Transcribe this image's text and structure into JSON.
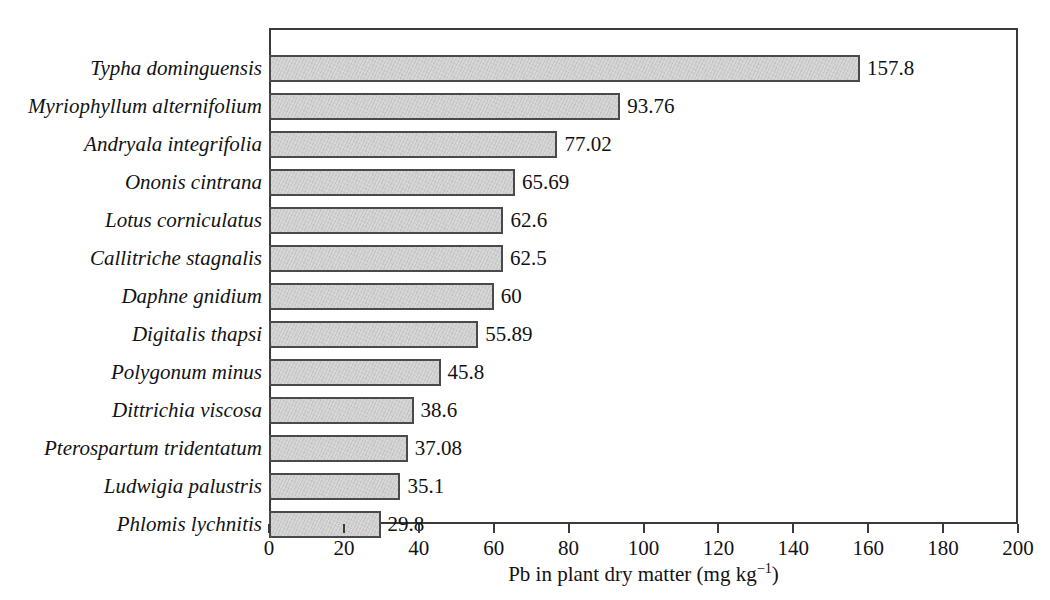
{
  "chart_data": {
    "type": "bar",
    "orientation": "horizontal",
    "title": "",
    "subtitle": "",
    "xlabel": "Pb in plant dry matter (mg kg⁻¹)",
    "xlabel_parts": {
      "prefix": "Pb in plant dry matter (mg kg",
      "exponent": "−1",
      "suffix": ")"
    },
    "ylabel": "",
    "xlim": [
      0,
      200
    ],
    "xticks": [
      0,
      20,
      40,
      60,
      80,
      100,
      120,
      140,
      160,
      180,
      200
    ],
    "xtick_labels": [
      "0",
      "20",
      "40",
      "60",
      "80",
      "100",
      "120",
      "140",
      "160",
      "180",
      "200"
    ],
    "grid": false,
    "legend": null,
    "bar_fill_color": "#d7d7d7",
    "bar_border_color": "#4a4a4a",
    "axis_color": "#3a3a3a",
    "categories": [
      "Typha dominguensis",
      "Myriophyllum alternifolium",
      "Andryala integrifolia",
      "Ononis cintrana",
      "Lotus corniculatus",
      "Callitriche stagnalis",
      "Daphne gnidium",
      "Digitalis thapsi",
      "Polygonum minus",
      "Dittrichia viscosa",
      "Pterospartum tridentatum",
      "Ludwigia palustris",
      "Phlomis lychnitis"
    ],
    "values": [
      157.8,
      93.76,
      77.02,
      65.69,
      62.6,
      62.5,
      60,
      55.89,
      45.8,
      38.6,
      37.08,
      35.1,
      29.8
    ],
    "value_labels": [
      "157.8",
      "93.76",
      "77.02",
      "65.69",
      "62.6",
      "62.5",
      "60",
      "55.89",
      "45.8",
      "38.6",
      "37.08",
      "35.1",
      "29.8"
    ]
  }
}
